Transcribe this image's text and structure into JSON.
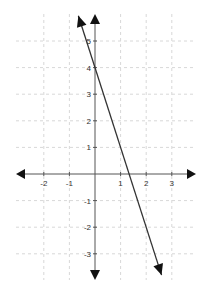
{
  "chart_data": {
    "type": "line",
    "title": "",
    "xlabel": "",
    "ylabel": "",
    "xlim": [
      -3,
      4
    ],
    "ylim": [
      -4,
      6
    ],
    "grid": true,
    "x_ticks": [
      -2,
      -1,
      1,
      2,
      3
    ],
    "y_ticks": [
      5,
      4,
      3,
      2,
      1,
      -1,
      -2,
      -3
    ],
    "series": [
      {
        "name": "y = -3x + 4",
        "slope": -3,
        "intercept": 4,
        "x": [
          -0.65,
          2.6
        ],
        "y": [
          5.95,
          -3.8
        ],
        "arrows": "both"
      }
    ],
    "axes_arrows": true
  },
  "colors": {
    "axis": "#555555",
    "line": "#333333",
    "grid": "#d8d8d8",
    "arrow": "#111111"
  }
}
